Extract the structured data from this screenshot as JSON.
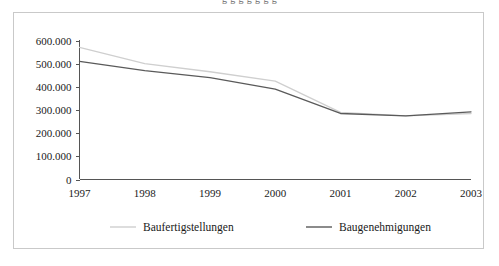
{
  "clipped_top_text": "g g g g g g g",
  "chart_data": {
    "type": "line",
    "title": "",
    "subtitle": "",
    "xlabel": "",
    "ylabel": "",
    "categories": [
      "1997",
      "1998",
      "1999",
      "2000",
      "2001",
      "2002",
      "2003"
    ],
    "x_tick_labels": [
      "1997",
      "1998",
      "1999",
      "2000",
      "2001",
      "2002",
      "2003"
    ],
    "y_tick_labels": [
      "0",
      "100.000",
      "200.000",
      "300.000",
      "400.000",
      "500.000",
      "600.000"
    ],
    "y_tick_values": [
      0,
      100000,
      200000,
      300000,
      400000,
      500000,
      600000
    ],
    "ylim": [
      0,
      600000
    ],
    "y_tick_step": 100000,
    "grid": false,
    "legend_position": "bottom",
    "number_format": "de-DE (period as thousands separator)",
    "series": [
      {
        "name": "Baufertigstellungen",
        "color": "#cfcfcf",
        "values": [
          570000,
          500000,
          465000,
          425000,
          290000,
          275000,
          285000
        ]
      },
      {
        "name": "Baugenehmigungen",
        "color": "#5a5a5a",
        "values": [
          510000,
          470000,
          440000,
          390000,
          285000,
          275000,
          292000
        ]
      }
    ]
  },
  "legend": {
    "items": [
      {
        "label": "Baufertigstellungen",
        "color": "#cfcfcf"
      },
      {
        "label": "Baugenehmigungen",
        "color": "#5a5a5a"
      }
    ]
  },
  "colors": {
    "frame_border": "#c9c9c9",
    "axis": "#555555",
    "background": "#ffffff",
    "series_light": "#cfcfcf",
    "series_dark": "#5a5a5a"
  }
}
